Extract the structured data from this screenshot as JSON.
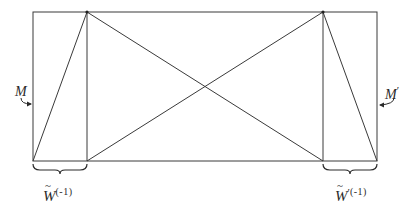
{
  "diagram": {
    "colors": {
      "line": "#3a3a3a",
      "text": "#2a2a2a",
      "background": "#ffffff"
    },
    "outer_rectangle": {
      "x1": 33,
      "y1": 12,
      "x2": 377,
      "y2": 161
    },
    "inner_verticals": [
      87,
      323
    ],
    "segments": [
      {
        "from": [
          33,
          161
        ],
        "to": [
          87,
          12
        ]
      },
      {
        "from": [
          87,
          12
        ],
        "to": [
          323,
          161
        ]
      },
      {
        "from": [
          87,
          161
        ],
        "to": [
          323,
          12
        ]
      },
      {
        "from": [
          323,
          12
        ],
        "to": [
          377,
          161
        ]
      }
    ],
    "vertex_dots": [
      [
        87,
        12
      ],
      [
        323,
        12
      ]
    ],
    "labels": {
      "left_arrow": {
        "symbol": "M",
        "prime": ""
      },
      "right_arrow": {
        "symbol": "M",
        "prime": "′"
      },
      "left_brace": {
        "symbol": "W",
        "tilde": "~",
        "prime": "",
        "superscript": "(-1)"
      },
      "right_brace": {
        "symbol": "W",
        "tilde": "~",
        "prime": "′",
        "superscript": "(-1)"
      }
    }
  }
}
